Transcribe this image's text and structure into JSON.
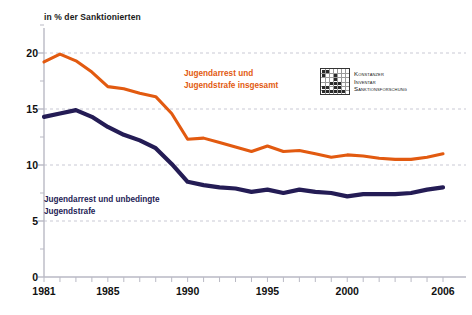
{
  "chart_data": {
    "type": "line",
    "title": "in % der Sanktionierten",
    "xlabel": "",
    "ylabel": "in % der Sanktionierten",
    "xlim": [
      1981,
      2006
    ],
    "ylim": [
      0,
      22
    ],
    "yticks": [
      0,
      5,
      10,
      15,
      20
    ],
    "ytick_labels": [
      "0",
      "5",
      "10",
      "15",
      "20"
    ],
    "yminor_step": 2.5,
    "xticks": [
      1981,
      1985,
      1990,
      1995,
      2000,
      2006
    ],
    "xtick_labels": [
      "1981",
      "1985",
      "1990",
      "1995",
      "2000",
      "2006"
    ],
    "grid": "horizontal-dashed",
    "legend_position": "inline-annotations",
    "x": [
      1981,
      1982,
      1983,
      1984,
      1985,
      1986,
      1987,
      1988,
      1989,
      1990,
      1991,
      1992,
      1993,
      1994,
      1995,
      1996,
      1997,
      1998,
      1999,
      2000,
      2001,
      2002,
      2003,
      2004,
      2005,
      2006
    ],
    "series": [
      {
        "name": "Jugendarrest und Jugendstrafe insgesamt",
        "color": "#E25A10",
        "values": [
          19.2,
          19.9,
          19.3,
          18.3,
          17.0,
          16.8,
          16.4,
          16.1,
          14.6,
          12.3,
          12.4,
          12.0,
          11.6,
          11.2,
          11.7,
          11.2,
          11.3,
          11.0,
          10.7,
          10.9,
          10.8,
          10.6,
          10.5,
          10.5,
          10.7,
          11.0
        ]
      },
      {
        "name": "Jugendarrest und unbedingte Jugendstrafe",
        "color": "#241C55",
        "values": [
          14.3,
          14.6,
          14.9,
          14.3,
          13.4,
          12.7,
          12.2,
          11.5,
          10.1,
          8.5,
          8.2,
          8.0,
          7.9,
          7.6,
          7.8,
          7.5,
          7.8,
          7.6,
          7.5,
          7.2,
          7.4,
          7.4,
          7.4,
          7.5,
          7.8,
          8.0
        ]
      }
    ]
  },
  "annotations": {
    "series_total_label_line1": "Jugendarrest und",
    "series_total_label_line2": "Jugendstrafe insgesamt",
    "series_unconditional_label_line1": "Jugendarrest und unbedingte",
    "series_unconditional_label_line2": "Jugendstrafe"
  },
  "logo": {
    "line1": "Konstanzer",
    "line2": "Inventar",
    "line3": "Sanktionsforschung"
  },
  "colors": {
    "orange": "#E25A10",
    "navy": "#241C55",
    "axis": "#b9b9c4",
    "grid": "#c9c9d4",
    "text": "#111111"
  }
}
